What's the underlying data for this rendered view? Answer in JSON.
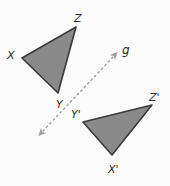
{
  "figure": {
    "type": "geometry-reflection-diagram",
    "background_color": "#fbfbfb",
    "canvas": {
      "width": 170,
      "height": 186
    },
    "style": {
      "triangle_fill": "#8a8a8a",
      "triangle_stroke": "#3a3a3a",
      "triangle_stroke_width": 1.6,
      "mirror_line_color": "#9d9d9d",
      "mirror_line_width": 1.4,
      "mirror_dash_pattern": "1.5 3.5",
      "label_color": "#2e2e2e"
    },
    "mirror_line": {
      "name": "g",
      "label": "g",
      "label_x": 122,
      "label_y": 54,
      "x1": 43,
      "y1": 131,
      "x2": 113,
      "y2": 57,
      "arrow_both_ends": true
    },
    "triangles": [
      {
        "name": "triangle-xyz",
        "points": "22,58 76,27 58,93",
        "vertices": [
          {
            "name": "X",
            "label": "X",
            "px": 22,
            "py": 58,
            "label_x": 7,
            "label_y": 59
          },
          {
            "name": "Z",
            "label": "Z",
            "px": 76,
            "py": 27,
            "label_x": 74,
            "label_y": 22
          },
          {
            "name": "Y",
            "label": "Y",
            "px": 58,
            "py": 93,
            "label_x": 56,
            "label_y": 108
          }
        ]
      },
      {
        "name": "triangle-x-prime-y-prime-z-prime",
        "points": "83,122 152,105 112,155",
        "vertices": [
          {
            "name": "Y-prime",
            "label": "Y'",
            "px": 83,
            "py": 122,
            "label_x": 71,
            "label_y": 118
          },
          {
            "name": "Z-prime",
            "label": "Z'",
            "px": 152,
            "py": 105,
            "label_x": 149,
            "label_y": 101
          },
          {
            "name": "X-prime",
            "label": "X'",
            "px": 112,
            "py": 155,
            "label_x": 108,
            "label_y": 173
          }
        ]
      }
    ]
  }
}
